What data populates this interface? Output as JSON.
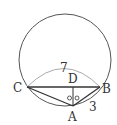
{
  "diagram": {
    "type": "geometry-circle-inscribed",
    "colors": {
      "stroke": "#444444",
      "arc": "#aaaaaa",
      "text": "#333333"
    },
    "circle": {
      "cx": 65,
      "cy": 60,
      "r": 46
    },
    "points": {
      "A": {
        "x": 73,
        "y": 106,
        "label": "A"
      },
      "B": {
        "x": 100,
        "y": 87,
        "label": "B"
      },
      "C": {
        "x": 27,
        "y": 87,
        "label": "C"
      },
      "D": {
        "x": 73,
        "y": 87,
        "label": "D"
      }
    },
    "measures": {
      "CB": "7",
      "AB": "3"
    },
    "angle_marks": "○○"
  }
}
